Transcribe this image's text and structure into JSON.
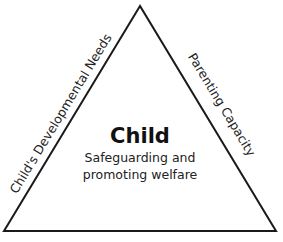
{
  "diagram": {
    "type": "triangle",
    "center": {
      "title": "Child",
      "subtitle_line1": "Safeguarding and",
      "subtitle_line2": "promoting welfare"
    },
    "sides": {
      "left": "Child's Developmental Needs",
      "right": "Parenting Capacity",
      "bottom": ""
    },
    "colors": {
      "stroke": "#1a1a1a",
      "background": "#ffffff"
    }
  }
}
